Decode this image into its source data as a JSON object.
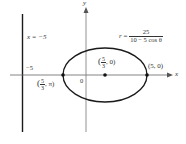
{
  "diagram": {
    "type": "polar conic (ellipse) with directrix",
    "equation": {
      "lhs": "r",
      "equals": "=",
      "numerator": "25",
      "denominator": "10 − 5 cos θ"
    },
    "directrix_label": "x = −5",
    "x_axis_label": "x",
    "y_axis_label": "y",
    "tick_minus5": "−5",
    "origin_label": "0",
    "points": {
      "focus": {
        "label_open": "(",
        "num": "5",
        "den": "3",
        "tail": ", 0)"
      },
      "left_vertex": {
        "label_open": "(",
        "num": "5",
        "den": "3",
        "tail": ", π)"
      },
      "right_vertex": {
        "label": "(5, 0)"
      }
    },
    "colors": {
      "curve": "#1a1a1a",
      "axes": "#555555",
      "directrix": "#1a1a1a",
      "text": "#333333"
    }
  }
}
